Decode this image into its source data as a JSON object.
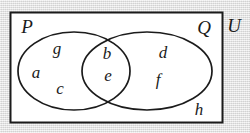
{
  "figure": {
    "kind": "venn-diagram",
    "stroke_color": "#1b1b1b",
    "fill_color": "#ffffff",
    "background_color": "#dcdcdc"
  },
  "universe": {
    "label": "U",
    "outside_element": "h"
  },
  "sets": [
    {
      "id": "P",
      "label": "P"
    },
    {
      "id": "Q",
      "label": "Q"
    }
  ],
  "regions": {
    "p_only": {
      "label": "P only",
      "elements": [
        "g",
        "a",
        "c"
      ]
    },
    "intersection": {
      "label": "P and Q",
      "elements": [
        "b",
        "e"
      ]
    },
    "q_only": {
      "label": "Q only",
      "elements": [
        "d",
        "f"
      ]
    },
    "outside": {
      "label": "Outside both sets",
      "elements": [
        "h"
      ]
    }
  },
  "elements": {
    "g": "g",
    "a": "a",
    "c": "c",
    "b": "b",
    "e": "e",
    "d": "d",
    "f": "f",
    "h": "h"
  }
}
